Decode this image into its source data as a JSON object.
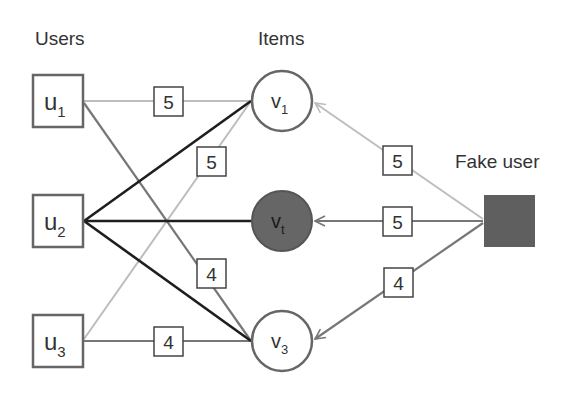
{
  "headers": {
    "users": "Users",
    "items": "Items",
    "fake_user": "Fake user"
  },
  "users": [
    {
      "id": "u1",
      "base": "u",
      "sub": "1"
    },
    {
      "id": "u2",
      "base": "u",
      "sub": "2"
    },
    {
      "id": "u3",
      "base": "u",
      "sub": "3"
    }
  ],
  "items": [
    {
      "id": "v1",
      "base": "v",
      "sub": "1",
      "target": false
    },
    {
      "id": "vt",
      "base": "v",
      "sub": "t",
      "target": true
    },
    {
      "id": "v3",
      "base": "v",
      "sub": "3",
      "target": false
    }
  ],
  "edges": [
    {
      "from": "u1",
      "to": "v1",
      "rating": "5",
      "style": "light"
    },
    {
      "from": "u1",
      "to": "v3",
      "rating": "4",
      "style": "medium"
    },
    {
      "from": "u2",
      "to": "v1",
      "rating": "",
      "style": "dark"
    },
    {
      "from": "u2",
      "to": "vt",
      "rating": "",
      "style": "dark"
    },
    {
      "from": "u2",
      "to": "v3",
      "rating": "",
      "style": "dark"
    },
    {
      "from": "u3",
      "to": "v1",
      "rating": "5",
      "style": "light"
    },
    {
      "from": "u3",
      "to": "v3",
      "rating": "4",
      "style": "medium"
    }
  ],
  "fake_edges": [
    {
      "from": "fake",
      "to": "v1",
      "rating": "5",
      "style": "light"
    },
    {
      "from": "fake",
      "to": "vt",
      "rating": "5",
      "style": "medium"
    },
    {
      "from": "fake",
      "to": "v3",
      "rating": "4",
      "style": "medium"
    }
  ],
  "colors": {
    "light_edge": "#bdbdbd",
    "medium_edge": "#777777",
    "dark_edge": "#1e1e1e",
    "node_border": "#666666",
    "target_fill": "#666666",
    "fake_fill": "#5f5f5f",
    "text": "#333333"
  }
}
